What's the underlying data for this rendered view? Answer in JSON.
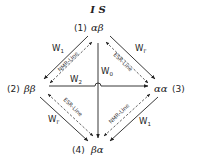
{
  "diagram": {
    "title": "I S",
    "states": [
      {
        "id": "1",
        "number": "(1)",
        "spins": "αβ"
      },
      {
        "id": "2",
        "number": "(2)",
        "spins": "ββ"
      },
      {
        "id": "3",
        "number": "(3)",
        "spins": "αα"
      },
      {
        "id": "4",
        "number": "(4)",
        "spins": "βα"
      }
    ],
    "transitions": {
      "w1_top_left": {
        "label": "W",
        "sub": "1",
        "from": "1",
        "to": "2"
      },
      "w1_top_right": {
        "label": "W",
        "sub": "I'",
        "from": "1",
        "to": "3"
      },
      "w1_bottom_left": {
        "label": "W",
        "sub": "I'",
        "from": "2",
        "to": "4"
      },
      "w1_bottom_right": {
        "label": "W",
        "sub": "1",
        "from": "3",
        "to": "4"
      },
      "w0": {
        "label": "W",
        "sub": "0",
        "from": "1",
        "to": "4"
      },
      "w2": {
        "label": "W",
        "sub": "2",
        "from": "2",
        "to": "3"
      }
    },
    "line_labels": {
      "nmr_top": "NMR-Line",
      "esr_top": "ESR-Line",
      "esr_bottom": "ESR-Line",
      "nmr_bottom": "NMR-Line"
    },
    "colors": {
      "ink": "#222222",
      "background": "#ffffff"
    }
  }
}
